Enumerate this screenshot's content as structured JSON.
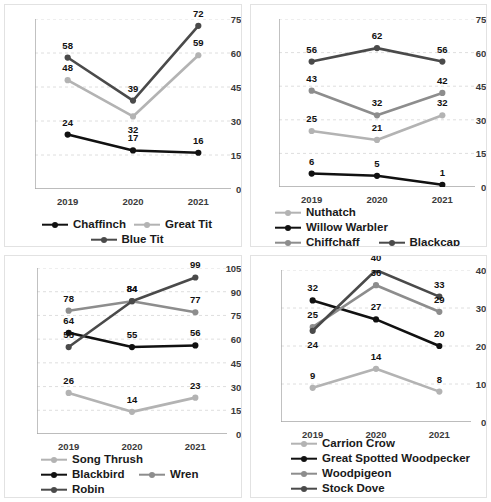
{
  "figure": {
    "panel_count": 4,
    "x_categories": [
      "2019",
      "2020",
      "2021"
    ]
  },
  "colors": {
    "black": "#111111",
    "dark_gray": "#4a4a4a",
    "mid_gray": "#8d8d8d",
    "light_gray": "#b3b3b3",
    "grid": "#dedede",
    "axis": "#a6a6a6",
    "panel_border": "#e2e2e2",
    "text": "#1a1a1a"
  },
  "chart_data": [
    {
      "id": "chart-chaffinch-greattit-bluetit",
      "type": "line",
      "title": "",
      "xlabel": "",
      "ylabel": "",
      "categories": [
        "2019",
        "2020",
        "2021"
      ],
      "ylim": [
        0,
        75
      ],
      "yticks": [
        0,
        15,
        30,
        45,
        60,
        75
      ],
      "grid": true,
      "legend_position": "bottom",
      "series": [
        {
          "name": "Chaffinch",
          "values": [
            24,
            17,
            16
          ],
          "color": "#111111",
          "label_offsets": [
            [
              0,
              -13
            ],
            [
              0,
              -13
            ],
            [
              0,
              -13
            ]
          ]
        },
        {
          "name": "Great Tit",
          "values": [
            48,
            32,
            59
          ],
          "color": "#b3b3b3",
          "label_offsets": [
            [
              0,
              -13
            ],
            [
              0,
              13
            ],
            [
              0,
              -13
            ]
          ]
        },
        {
          "name": "Blue Tit",
          "values": [
            58,
            39,
            72
          ],
          "color": "#4a4a4a",
          "label_offsets": [
            [
              0,
              -13
            ],
            [
              0,
              -13
            ],
            [
              0,
              -13
            ]
          ]
        }
      ]
    },
    {
      "id": "chart-nuthatch-willowwarbler-chiffchaff-blackcap",
      "type": "line",
      "title": "",
      "xlabel": "",
      "ylabel": "",
      "categories": [
        "2019",
        "2020",
        "2021"
      ],
      "ylim": [
        0,
        75
      ],
      "yticks": [
        0,
        15,
        30,
        45,
        60,
        75
      ],
      "grid": true,
      "legend_position": "bottom",
      "series": [
        {
          "name": "Nuthatch",
          "values": [
            25,
            21,
            32
          ],
          "color": "#b3b3b3",
          "label_offsets": [
            [
              0,
              -13
            ],
            [
              0,
              -13
            ],
            [
              0,
              -13
            ]
          ]
        },
        {
          "name": "Willow Warbler",
          "values": [
            6,
            5,
            1
          ],
          "color": "#111111",
          "label_offsets": [
            [
              0,
              -13
            ],
            [
              0,
              -13
            ],
            [
              0,
              -13
            ]
          ]
        },
        {
          "name": "Chiffchaff",
          "values": [
            43,
            32,
            42
          ],
          "color": "#8d8d8d",
          "label_offsets": [
            [
              0,
              -13
            ],
            [
              0,
              -13
            ],
            [
              0,
              -13
            ]
          ]
        },
        {
          "name": "Blackcap",
          "values": [
            56,
            62,
            56
          ],
          "color": "#4a4a4a",
          "label_offsets": [
            [
              0,
              -13
            ],
            [
              0,
              -13
            ],
            [
              0,
              -13
            ]
          ]
        }
      ]
    },
    {
      "id": "chart-songthrush-blackbird-wren-robin",
      "type": "line",
      "title": "",
      "xlabel": "",
      "ylabel": "",
      "categories": [
        "2019",
        "2020",
        "2021"
      ],
      "ylim": [
        0,
        105
      ],
      "yticks": [
        0,
        15,
        30,
        45,
        60,
        75,
        90,
        105
      ],
      "grid": true,
      "legend_position": "bottom",
      "series": [
        {
          "name": "Song Thrush",
          "values": [
            26,
            14,
            23
          ],
          "color": "#b3b3b3",
          "label_offsets": [
            [
              0,
              -13
            ],
            [
              0,
              -13
            ],
            [
              0,
              -13
            ]
          ]
        },
        {
          "name": "Blackbird",
          "values": [
            64,
            55,
            56
          ],
          "color": "#111111",
          "label_offsets": [
            [
              0,
              -13
            ],
            [
              0,
              -13
            ],
            [
              0,
              -13
            ]
          ]
        },
        {
          "name": "Wren",
          "values": [
            78,
            84,
            77
          ],
          "color": "#8d8d8d",
          "label_offsets": [
            [
              0,
              -13
            ],
            [
              0,
              -13
            ],
            [
              0,
              -13
            ]
          ]
        },
        {
          "name": "Robin",
          "values": [
            55,
            84,
            99
          ],
          "color": "#4a4a4a",
          "label_offsets": [
            [
              0,
              -13
            ],
            [
              0,
              -13
            ],
            [
              0,
              -13
            ]
          ]
        }
      ]
    },
    {
      "id": "chart-carrioncrow-gsw-woodpigeon-stockdove",
      "type": "line",
      "title": "",
      "xlabel": "",
      "ylabel": "",
      "categories": [
        "2019",
        "2020",
        "2021"
      ],
      "ylim": [
        0,
        40
      ],
      "yticks": [
        0,
        10,
        20,
        30,
        40
      ],
      "grid": true,
      "legend_position": "bottom",
      "series": [
        {
          "name": "Carrion Crow",
          "values": [
            9,
            14,
            8
          ],
          "color": "#b3b3b3",
          "label_offsets": [
            [
              0,
              -13
            ],
            [
              0,
              -13
            ],
            [
              0,
              -13
            ]
          ]
        },
        {
          "name": "Great Spotted Woodpecker",
          "values": [
            32,
            27,
            20
          ],
          "color": "#111111",
          "label_offsets": [
            [
              0,
              -13
            ],
            [
              0,
              -13
            ],
            [
              0,
              -13
            ]
          ]
        },
        {
          "name": "Woodpigeon",
          "values": [
            25,
            36,
            29
          ],
          "color": "#8d8d8d",
          "label_offsets": [
            [
              0,
              -13
            ],
            [
              0,
              -13
            ],
            [
              0,
              -13
            ]
          ]
        },
        {
          "name": "Stock Dove",
          "values": [
            24,
            40,
            33
          ],
          "color": "#4a4a4a",
          "label_offsets": [
            [
              0,
              13
            ],
            [
              0,
              -13
            ],
            [
              0,
              -13
            ]
          ]
        }
      ]
    }
  ]
}
